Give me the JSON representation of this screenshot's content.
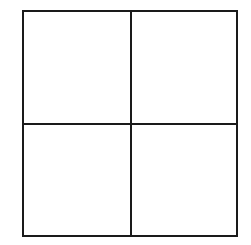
{
  "diagram": {
    "type": "grid",
    "rows": 2,
    "columns": 2,
    "line_color": "#1a1a1a",
    "background": "#ffffff",
    "cells": [
      {
        "row": 0,
        "col": 0,
        "label": ""
      },
      {
        "row": 0,
        "col": 1,
        "label": ""
      },
      {
        "row": 1,
        "col": 0,
        "label": ""
      },
      {
        "row": 1,
        "col": 1,
        "label": ""
      }
    ]
  }
}
